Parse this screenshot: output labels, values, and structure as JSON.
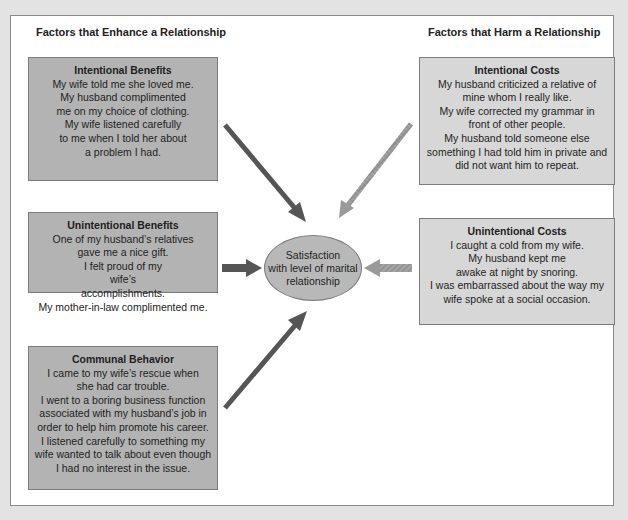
{
  "headings": {
    "enhance": "Factors that Enhance a Relationship",
    "harm": "Factors that Harm a Relationship"
  },
  "center": {
    "lines": [
      "Satisfaction",
      "with level of marital",
      "relationship"
    ]
  },
  "boxes": {
    "intentional_benefits": {
      "title": "Intentional Benefits",
      "items": [
        "My wife told me she loved me.",
        "My husband complimented me on my choice of clothing.",
        "My wife listened carefully to me when I told her about a problem I had."
      ]
    },
    "unintentional_benefits": {
      "title": "Unintentional Benefits",
      "items": [
        "One of my husband’s relatives gave me a nice gift.",
        "I felt proud of my wife’s accomplishments.",
        "My mother-in-law complimented me."
      ]
    },
    "communal_behavior": {
      "title": "Communal Behavior",
      "items": [
        "I came to my wife’s rescue when she had car trouble.",
        "I went to a boring business function associated with my husband’s job in order to help him promote his career.",
        "I listened carefully to something my wife wanted to talk about even though I had no interest in the issue."
      ]
    },
    "intentional_costs": {
      "title": "Intentional Costs",
      "items": [
        "My husband criticized a relative of mine whom I really like.",
        "My wife corrected my grammar in front of other people.",
        "My husband told someone else something I had told him in private and did not want him to repeat."
      ]
    },
    "unintentional_costs": {
      "title": "Unintentional Costs",
      "items": [
        "I caught a cold from my wife.",
        "My husband kept me awake at night by snoring.",
        "I was embarrassed about the way my wife spoke at a social occasion."
      ]
    }
  },
  "colors": {
    "enhance_box": "#b3b3b3",
    "harm_box": "#d7d7d7",
    "enhance_arrow": "#555555",
    "harm_arrow": "#9a9a9a",
    "ellipse": "#b8b8b8"
  }
}
